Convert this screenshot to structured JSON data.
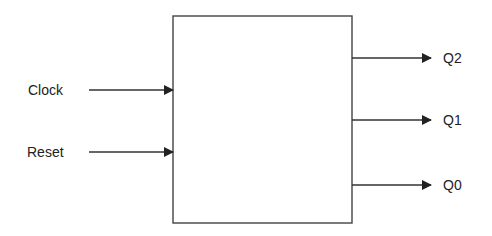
{
  "diagram": {
    "type": "block-diagram",
    "block": {
      "label": ""
    },
    "inputs": [
      {
        "label": "Clock"
      },
      {
        "label": "Reset"
      }
    ],
    "outputs": [
      {
        "label": "Q2"
      },
      {
        "label": "Q1"
      },
      {
        "label": "Q0"
      }
    ],
    "colors": {
      "stroke": "#333333",
      "background": "#ffffff"
    }
  }
}
